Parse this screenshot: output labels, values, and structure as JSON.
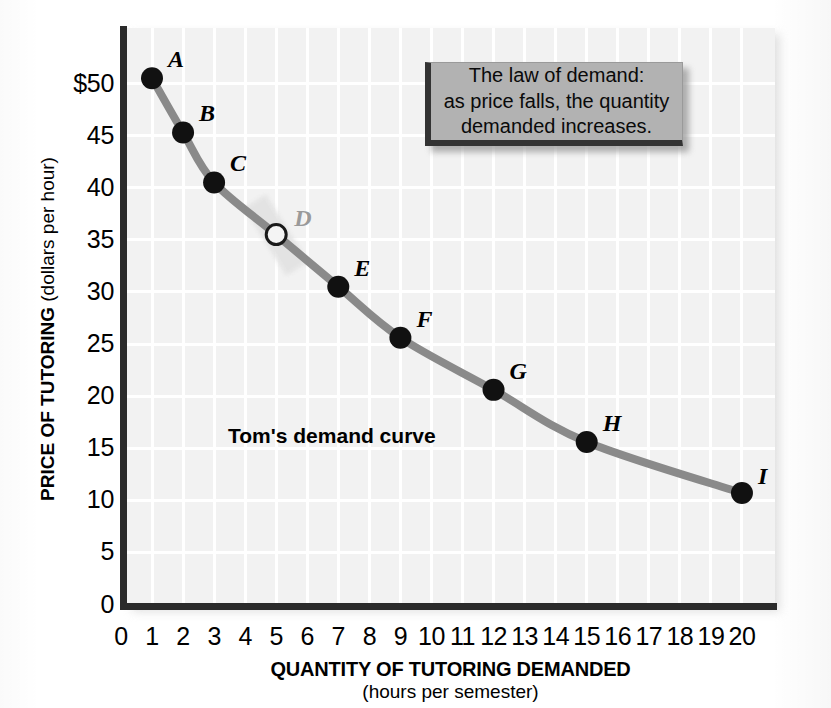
{
  "chart_data": {
    "type": "line",
    "title": "",
    "xlabel": "QUANTITY OF TUTORING DEMANDED",
    "xsublabel": "(hours per semester)",
    "ylabel_bold": "PRICE OF TUTORING",
    "ylabel_plain": " (dollars per hour)",
    "xlim": [
      0,
      20
    ],
    "ylim": [
      0,
      52
    ],
    "grid": true,
    "legend": "none",
    "series_name": "Tom's demand curve",
    "x": [
      1,
      2,
      3,
      5,
      7,
      9,
      12,
      15,
      20
    ],
    "y": [
      50.5,
      45.3,
      40.5,
      35.5,
      30.5,
      25.6,
      20.6,
      15.6,
      10.7
    ],
    "point_labels": [
      "A",
      "B",
      "C",
      "D",
      "E",
      "F",
      "G",
      "H",
      "I"
    ],
    "point_styles": [
      "filled",
      "filled",
      "filled",
      "open",
      "filled",
      "filled",
      "filled",
      "filled",
      "filled"
    ],
    "xticks": [
      "0",
      "1",
      "2",
      "3",
      "4",
      "5",
      "6",
      "7",
      "8",
      "9",
      "10",
      "11",
      "12",
      "13",
      "14",
      "15",
      "16",
      "17",
      "18",
      "19",
      "20"
    ],
    "yticks": [
      {
        "label": "$50",
        "value": 50
      },
      {
        "label": "45",
        "value": 45
      },
      {
        "label": "40",
        "value": 40
      },
      {
        "label": "35",
        "value": 35
      },
      {
        "label": "30",
        "value": 30
      },
      {
        "label": "25",
        "value": 25
      },
      {
        "label": "20",
        "value": 20
      },
      {
        "label": "15",
        "value": 15
      },
      {
        "label": "10",
        "value": 10
      },
      {
        "label": "5",
        "value": 5
      },
      {
        "label": "0",
        "value": 0
      }
    ],
    "annotations": [
      {
        "name": "curve-caption",
        "text": "Tom's demand curve"
      },
      {
        "name": "callout",
        "lines": [
          "The law of demand:",
          "as price falls, the quantity",
          "demanded increases."
        ]
      }
    ],
    "colors": {
      "curve": "#8a8a8a",
      "plot_background": "#f2f2f2",
      "gridline": "#ffffff",
      "axis": "#2b2b2b",
      "point_fill": "#111111",
      "callout_fill": "#b2b2b2",
      "callout_border": "#333333",
      "ghost_label": "#9a9a9a"
    }
  },
  "callout": {
    "line1": "The law of demand:",
    "line2": "as price falls, the quantity",
    "line3": "demanded increases."
  },
  "curve_caption": "Tom's demand curve",
  "axis": {
    "x_title": "QUANTITY OF TUTORING DEMANDED",
    "x_subtitle": "(hours per semester)",
    "y_title_bold": "PRICE OF TUTORING",
    "y_title_plain": " (dollars per hour)"
  }
}
